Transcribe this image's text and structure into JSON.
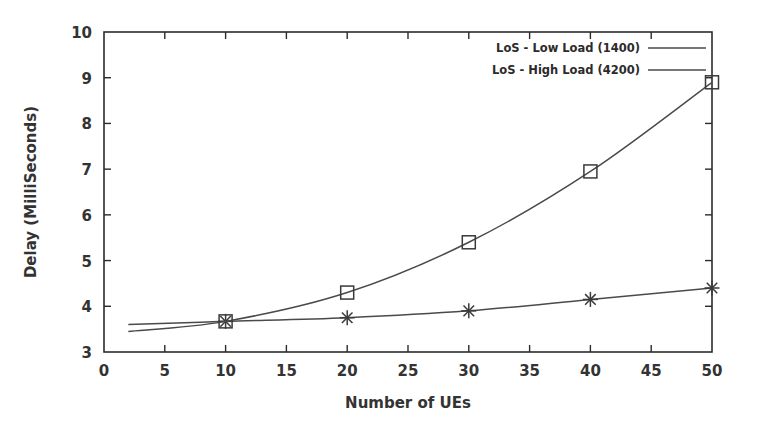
{
  "chart_data": {
    "type": "line",
    "title": "",
    "subtitle": "",
    "xlabel": "Number of UEs",
    "ylabel": "Delay (MilliSeconds)",
    "xlim": [
      0,
      50
    ],
    "ylim": [
      3,
      10
    ],
    "xticks": [
      0,
      5,
      10,
      15,
      20,
      25,
      30,
      35,
      40,
      45,
      50
    ],
    "yticks": [
      3,
      4,
      5,
      6,
      7,
      8,
      9,
      10
    ],
    "xtick_labels": [
      "0",
      "5",
      "10",
      "15",
      "20",
      "25",
      "30",
      "35",
      "40",
      "45",
      "50"
    ],
    "ytick_labels": [
      "3",
      "4",
      "5",
      "6",
      "7",
      "8",
      "9",
      "10"
    ],
    "grid": false,
    "legend_position": "top-right",
    "x": [
      10,
      20,
      30,
      40,
      50
    ],
    "series": [
      {
        "name": "LoS - Low Load (1400)",
        "marker": "star",
        "color": "#4a4a4a",
        "values": [
          3.67,
          3.75,
          3.9,
          4.15,
          4.4
        ],
        "curve_start": {
          "x": 2,
          "y": 3.6
        }
      },
      {
        "name": "LoS - High Load (4200)",
        "marker": "square",
        "color": "#4a4a4a",
        "values": [
          3.67,
          4.3,
          5.4,
          6.95,
          8.9
        ],
        "curve_start": {
          "x": 2,
          "y": 3.45
        }
      }
    ]
  },
  "legend": {
    "entries": [
      {
        "label": "LoS - Low Load (1400)"
      },
      {
        "label": "LoS - High Load (4200)"
      }
    ]
  },
  "axes": {
    "x_title": "Number of UEs",
    "y_title": "Delay (MilliSeconds)"
  }
}
